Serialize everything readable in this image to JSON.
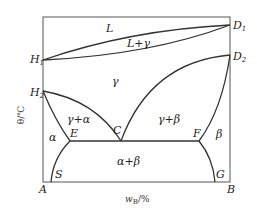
{
  "diagram": {
    "type": "binary phase diagram",
    "y_axis_label": "θ/℃",
    "x_axis_label": "w",
    "x_axis_label_sub": "B",
    "x_axis_label_unit": "/%",
    "points": {
      "H1": {
        "main": "H",
        "sub": "1"
      },
      "H2": {
        "main": "H",
        "sub": "2"
      },
      "D1": {
        "main": "D",
        "sub": "1"
      },
      "D2": {
        "main": "D",
        "sub": "2"
      },
      "A": "A",
      "B": "B",
      "C": "C",
      "E": "E",
      "F": "F",
      "S": "S",
      "G": "G"
    },
    "regions": {
      "liquid": "L",
      "liquid_gamma": "L+γ",
      "gamma": "γ",
      "gamma_alpha": "γ+α",
      "gamma_beta": "γ+β",
      "alpha": "α",
      "beta": "β",
      "alpha_beta": "α+β"
    }
  }
}
